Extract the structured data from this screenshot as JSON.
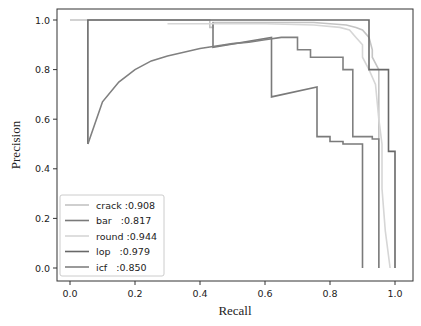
{
  "chart_data": {
    "type": "line",
    "title": "",
    "xlabel": "Recall",
    "ylabel": "Precision",
    "xlim": [
      -0.04,
      1.06
    ],
    "ylim": [
      -0.04,
      1.05
    ],
    "xticks": [
      "0.0",
      "0.2",
      "0.4",
      "0.6",
      "0.8",
      "1.0"
    ],
    "yticks": [
      "0.0",
      "0.2",
      "0.4",
      "0.6",
      "0.8",
      "1.0"
    ],
    "grid": false,
    "legend_position": "lower left",
    "series": [
      {
        "name": "crack :0.908",
        "color": "#c4c4c4",
        "x": [
          0.0,
          0.43,
          0.43,
          0.44,
          0.44,
          0.6,
          0.75,
          0.85,
          0.88,
          0.9,
          0.92,
          0.93,
          0.93,
          0.95,
          0.95
        ],
        "y": [
          1.0,
          1.0,
          0.97,
          0.97,
          0.99,
          0.99,
          0.99,
          0.98,
          0.97,
          0.96,
          0.93,
          0.88,
          0.85,
          0.8,
          0.0
        ]
      },
      {
        "name": "bar   :0.817",
        "color": "#7a7a7a",
        "x": [
          0.44,
          0.44,
          0.62,
          0.62,
          0.76,
          0.76,
          0.8,
          0.8,
          0.84,
          0.84,
          0.9,
          0.9
        ],
        "y": [
          0.99,
          0.89,
          0.93,
          0.69,
          0.73,
          0.53,
          0.53,
          0.51,
          0.51,
          0.5,
          0.5,
          0.0
        ]
      },
      {
        "name": "round :0.944",
        "color": "#d6d6d6",
        "x": [
          0.3,
          0.6,
          0.75,
          0.83,
          0.86,
          0.88,
          0.9,
          0.9,
          0.92,
          0.94,
          0.95,
          0.96,
          0.96,
          0.97,
          0.985
        ],
        "y": [
          0.985,
          0.985,
          0.98,
          0.97,
          0.96,
          0.93,
          0.9,
          0.85,
          0.8,
          0.74,
          0.6,
          0.5,
          0.32,
          0.15,
          0.0
        ]
      },
      {
        "name": "lop   :0.979",
        "color": "#686868",
        "x": [
          0.055,
          0.055,
          0.92,
          0.92,
          0.98,
          0.98,
          1.0,
          1.0
        ],
        "y": [
          0.5,
          1.0,
          1.0,
          0.8,
          0.8,
          0.47,
          0.47,
          0.0
        ]
      },
      {
        "name": "icf   :0.850",
        "color": "#808080",
        "x": [
          0.055,
          0.1,
          0.15,
          0.2,
          0.25,
          0.3,
          0.35,
          0.4,
          0.45,
          0.5,
          0.55,
          0.6,
          0.65,
          0.7,
          0.7,
          0.74,
          0.74,
          0.84,
          0.84,
          0.87,
          0.87,
          0.93,
          0.93,
          0.95,
          0.95
        ],
        "y": [
          0.5,
          0.67,
          0.75,
          0.8,
          0.835,
          0.855,
          0.87,
          0.885,
          0.895,
          0.905,
          0.91,
          0.92,
          0.93,
          0.93,
          0.88,
          0.88,
          0.85,
          0.85,
          0.8,
          0.8,
          0.53,
          0.53,
          0.52,
          0.52,
          0.0
        ]
      }
    ]
  }
}
